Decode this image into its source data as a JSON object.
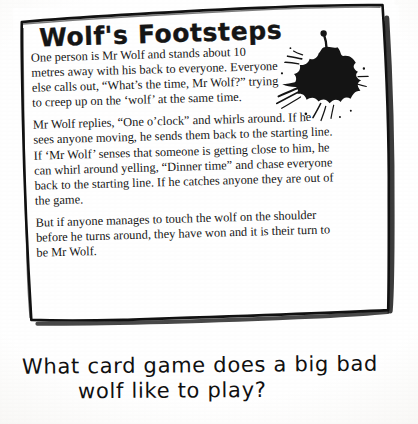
{
  "card": {
    "title": "Wolf's Footsteps",
    "paragraphs": [
      "One person is Mr Wolf and stands about 10 metres away with his back to everyone. Everyone else calls out, “What’s the time, Mr Wolf?” trying to creep up on the ‘wolf’ at the same time.",
      "Mr Wolf replies, “One o’clock” and whirls around. If he sees anyone moving, he sends them back to the starting line. If ‘Mr Wolf’ senses that someone is getting close to him, he can whirl around yelling, “Dinner time” and chase everyone back to the starting line. If he catches anyone they are out of the game.",
      "But if anyone manages to touch the wolf on the shoulder before he turns around, they have won and it is their turn to be Mr Wolf."
    ],
    "decoration": "ink-splat"
  },
  "riddle": {
    "line_1": "What card game does a big bad",
    "line_2": "wolf like to play?"
  },
  "colors": {
    "ink": "#141414",
    "paper": "#ffffff",
    "border": "#111111"
  }
}
